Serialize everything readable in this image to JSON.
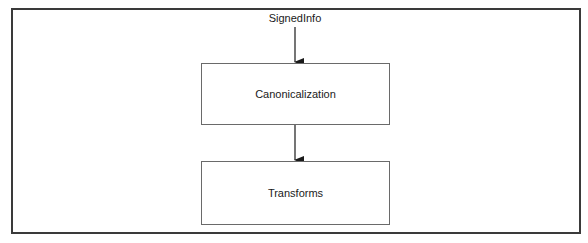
{
  "diagram": {
    "input_label": "SignedInfo",
    "nodes": [
      {
        "id": "canonicalization",
        "label": "Canonicalization"
      },
      {
        "id": "transforms",
        "label": "Transforms"
      }
    ],
    "edges": [
      {
        "from": "SignedInfo",
        "to": "canonicalization"
      },
      {
        "from": "canonicalization",
        "to": "transforms"
      }
    ],
    "colors": {
      "stroke": "#3a3a3a",
      "box_border": "#6a6a6a",
      "background": "#ffffff"
    }
  }
}
